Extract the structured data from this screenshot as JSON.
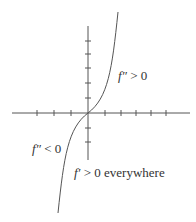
{
  "diagram": {
    "title": "",
    "colors": {
      "axis": "#555555",
      "curve": "#555555",
      "text": "#333333",
      "background": "#ffffff"
    },
    "axes": {
      "origin_px": [
        88,
        113
      ],
      "x_ticks_px": [
        37,
        54,
        71,
        105,
        121,
        136,
        151,
        166
      ],
      "y_ticks_px": [
        41,
        54,
        68,
        83,
        98,
        128,
        142
      ]
    },
    "labels": {
      "upper_right": {
        "fn": "f″",
        "rel": " > 0"
      },
      "lower_left": {
        "fn": "f″",
        "rel": " < 0"
      },
      "bottom": {
        "fn": "f′",
        "rel": " > 0 everywhere"
      }
    }
  }
}
